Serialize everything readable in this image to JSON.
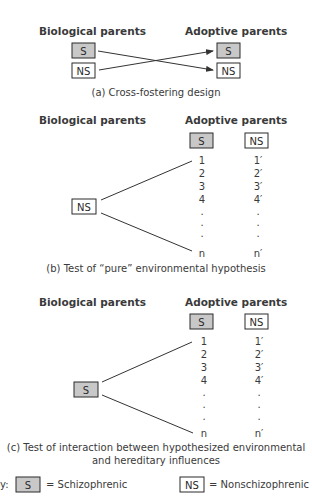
{
  "panel_a": {
    "header_left": "Biological parents",
    "header_right": "Adoptive parents",
    "bio_boxes": [
      "S",
      "NS"
    ],
    "adoptive_boxes": [
      "S",
      "NS"
    ],
    "caption": "(a) Cross-fostering design"
  },
  "panel_b": {
    "header_left": "Biological parents",
    "header_right": "Adoptive parents",
    "bio_box": "NS",
    "col_s_label": "S",
    "col_ns_label": "NS",
    "col_s_items": [
      "1",
      "2",
      "3",
      "4",
      ".",
      ".",
      ".",
      "n"
    ],
    "col_ns_items": [
      "1′",
      "2′",
      "3′",
      "4′",
      ".",
      ".",
      ".",
      "n′"
    ],
    "caption": "(b) Test of “pure” environmental hypothesis"
  },
  "panel_c": {
    "header_left": "Biological parents",
    "header_right": "Adoptive parents",
    "bio_box": "S",
    "col_s_label": "S",
    "col_ns_label": "NS",
    "col_s_items": [
      "1",
      "2",
      "3",
      "4",
      ".",
      ".",
      ".",
      "n"
    ],
    "col_ns_items": [
      "1′",
      "2′",
      "3′",
      "4′",
      ".",
      ".",
      ".",
      "n′"
    ],
    "caption_line1": "(c) Test of interaction between hypothesized environmental",
    "caption_line2": "and hereditary influences"
  },
  "key": {
    "prefix": "y:",
    "s_box": "S",
    "s_meaning": "= Schizophrenic",
    "ns_box": "NS",
    "ns_meaning": "= Nonschizophrenic"
  },
  "colors": {
    "schizophrenic_fill": "#c8c8c8",
    "nonschizophrenic_fill": "#ffffff",
    "ink": "#2a2a2a"
  }
}
